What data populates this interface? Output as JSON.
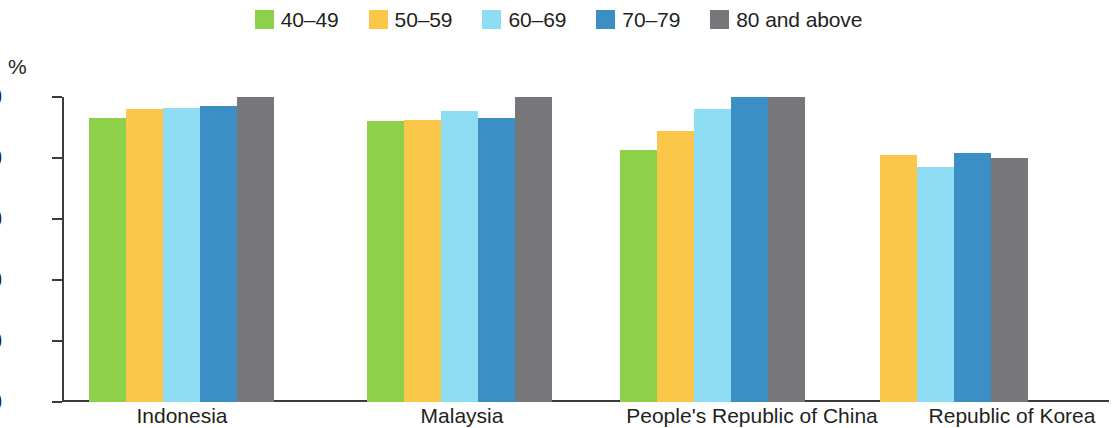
{
  "legend": {
    "items": [
      {
        "label": "40–49",
        "color": "#8DD04A",
        "swatch_icon": "legend-swatch-square"
      },
      {
        "label": "50–59",
        "color": "#FAC749",
        "swatch_icon": "legend-swatch-square"
      },
      {
        "label": "60–69",
        "color": "#8FDCF5",
        "swatch_icon": "legend-swatch-square"
      },
      {
        "label": "70–79",
        "color": "#3C8FC4",
        "swatch_icon": "legend-swatch-square"
      },
      {
        "label": "80 and above",
        "color": "#77767A",
        "swatch_icon": "legend-swatch-square"
      }
    ]
  },
  "axis": {
    "unit_label": "%",
    "y_ticks": [
      "100",
      "80",
      "60",
      "40",
      "20",
      "0"
    ]
  },
  "chart_data": {
    "type": "bar",
    "title": "",
    "xlabel": "",
    "ylabel": "%",
    "ylim": [
      0,
      100
    ],
    "ytick_step": 20,
    "grid": false,
    "legend_position": "top-center",
    "categories": [
      "Indonesia",
      "Malaysia",
      "People's Republic of China",
      "Republic of Korea"
    ],
    "series": [
      {
        "name": "40–49",
        "color": "#8DD04A",
        "values": [
          93,
          92,
          82.5,
          null
        ]
      },
      {
        "name": "50–59",
        "color": "#FAC749",
        "values": [
          96,
          92.5,
          89,
          81
        ]
      },
      {
        "name": "60–69",
        "color": "#8FDCF5",
        "values": [
          96.5,
          95.5,
          96,
          77
        ]
      },
      {
        "name": "70–79",
        "color": "#3C8FC4",
        "values": [
          97,
          93,
          100,
          81.5
        ]
      },
      {
        "name": "80 and above",
        "color": "#77767A",
        "values": [
          100,
          100,
          100,
          80
        ]
      }
    ]
  }
}
